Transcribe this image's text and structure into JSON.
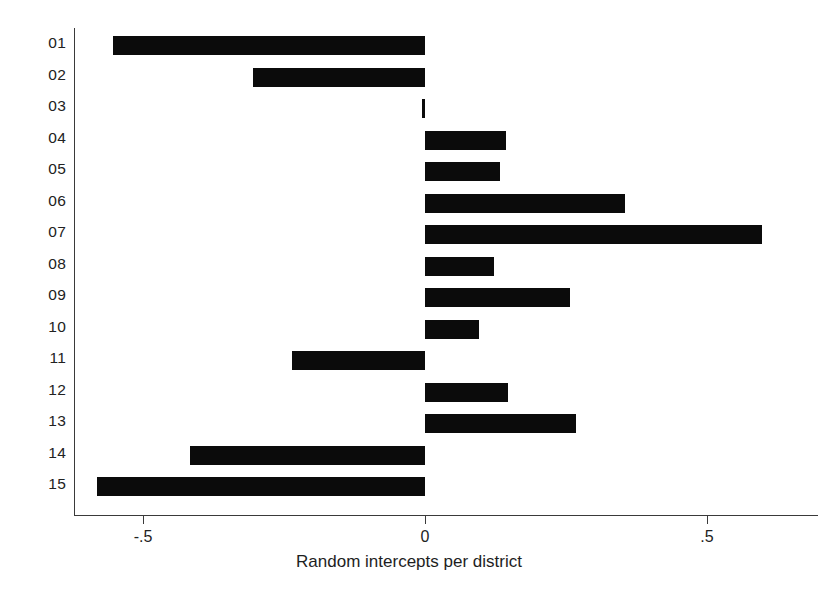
{
  "chart_data": {
    "type": "bar",
    "orientation": "horizontal",
    "title": "",
    "xlabel": "Random intercepts per district",
    "ylabel": "",
    "categories": [
      "01",
      "02",
      "03",
      "04",
      "05",
      "06",
      "07",
      "08",
      "09",
      "10",
      "11",
      "12",
      "13",
      "14",
      "15"
    ],
    "values": [
      -0.553,
      -0.305,
      -0.005,
      0.144,
      0.133,
      0.355,
      0.597,
      0.122,
      0.257,
      0.096,
      -0.236,
      0.147,
      0.268,
      -0.417,
      -0.582
    ],
    "xlim": [
      -0.62,
      0.695
    ],
    "xticks": [
      -0.5,
      0,
      0.5
    ],
    "xtick_labels": [
      "-.5",
      "0",
      ".5"
    ],
    "grid": false,
    "legend": null,
    "bar_color": "#0b0b0b",
    "background_color": "#ffffff",
    "axis_color": "#3a3a3a"
  }
}
